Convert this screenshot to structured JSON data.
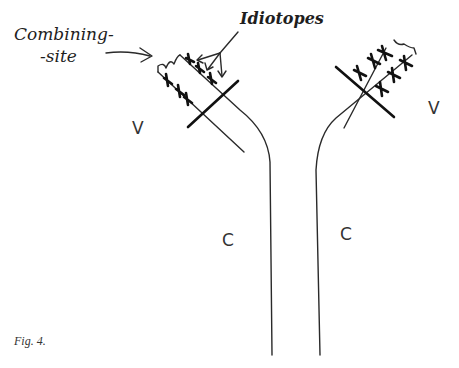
{
  "figure": {
    "caption": "Fig. 4.",
    "labels": {
      "combining_site_line1": "Combining-",
      "combining_site_line2": "-site",
      "idiotopes": "Idiotopes",
      "v_left": "V",
      "v_right": "V",
      "c_left": "C",
      "c_right": "C"
    },
    "colors": {
      "ink": "#1e1e1e",
      "background": "#ffffff"
    }
  }
}
